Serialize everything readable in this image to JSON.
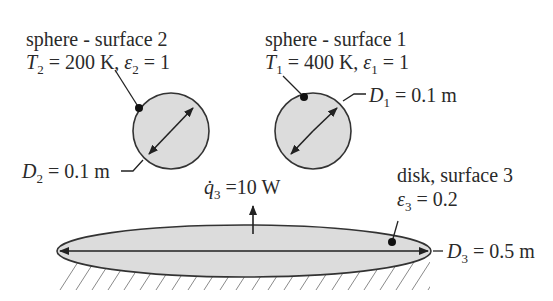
{
  "sphere2": {
    "title": "sphere - surface 2",
    "temp_symbol": "T",
    "temp_sub": "2",
    "temp_value": " = 200 K, ",
    "emis_symbol": "ε",
    "emis_sub": "2",
    "emis_value": " = 1",
    "diameter_symbol": "D",
    "diameter_sub": "2",
    "diameter_value": " = 0.1 m"
  },
  "sphere1": {
    "title": "sphere - surface 1",
    "temp_symbol": "T",
    "temp_sub": "1",
    "temp_value": " = 400 K, ",
    "emis_symbol": "ε",
    "emis_sub": "1",
    "emis_value": " = 1",
    "diameter_symbol": "D",
    "diameter_sub": "1",
    "diameter_value": " = 0.1 m"
  },
  "disk": {
    "title": "disk, surface 3",
    "emis_symbol": "ε",
    "emis_sub": "3",
    "emis_value": " = 0.2",
    "diameter_symbol": "D",
    "diameter_sub": "3",
    "diameter_value": " = 0.5 m",
    "heat_symbol": "q̇",
    "heat_sub": "3",
    "heat_value": " =10 W"
  },
  "colors": {
    "fill": "#dcdcdc",
    "stroke": "#333333"
  }
}
